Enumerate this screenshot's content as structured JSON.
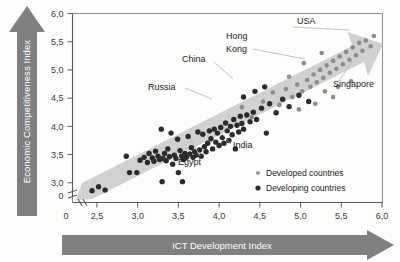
{
  "axes": {
    "y_title": "Economic Competitiveness Index",
    "x_title": "ICT Development Index",
    "y_ticks": [
      "6,0",
      "5,5",
      "5,0",
      "4,5",
      "4,0",
      "3,5",
      "3,0",
      "0"
    ],
    "x_ticks": [
      "0",
      "2,5",
      "3,0",
      "3,5",
      "4,0",
      "4,5",
      "5,0",
      "5,5",
      "6,0"
    ],
    "y_break": true,
    "x_break": true
  },
  "legend": {
    "items": [
      {
        "label": "Developed countries",
        "marker": "small-square",
        "color": "#9a9a9a"
      },
      {
        "label": "Developing countries",
        "marker": "dot",
        "color": "#2b2b2b"
      }
    ]
  },
  "annotations": [
    {
      "name": "usa",
      "text": "USA"
    },
    {
      "name": "hong-kong",
      "text": "Hong\nKong",
      "line1": "Hong",
      "line2": "Kong"
    },
    {
      "name": "china",
      "text": "China"
    },
    {
      "name": "russia",
      "text": "Russia"
    },
    {
      "name": "singapore",
      "text": "Singapore"
    },
    {
      "name": "india",
      "text": "India"
    },
    {
      "name": "egypt",
      "text": "Egypt"
    }
  ],
  "colors": {
    "arrow_gray": "#808080",
    "band_gray": "#cfcfcf",
    "developing": "#2b2b2b",
    "developed": "#8c8c8c",
    "frame": "#8e8e8e"
  },
  "chart_data": {
    "type": "scatter",
    "title": "",
    "xlabel": "ICT Development Index",
    "ylabel": "Economic Competitiveness Index",
    "xlim": [
      2.2,
      6.0
    ],
    "ylim": [
      2.65,
      6.0
    ],
    "grid": false,
    "legend_position": "inside-bottom-right",
    "trend_band": {
      "description": "shaded gray upward band with arrowhead at top-right",
      "x_start": 2.35,
      "y_start": 2.85,
      "x_end": 5.95,
      "y_end": 5.75,
      "half_width": 0.33
    },
    "series": [
      {
        "name": "Developing countries",
        "color": "#2b2b2b",
        "marker": "circle",
        "points": [
          [
            2.44,
            2.86
          ],
          [
            2.52,
            2.93
          ],
          [
            2.6,
            2.87
          ],
          [
            2.86,
            3.47
          ],
          [
            2.99,
            3.18
          ],
          [
            3.03,
            3.4
          ],
          [
            3.08,
            3.45
          ],
          [
            3.12,
            3.36
          ],
          [
            3.14,
            3.52
          ],
          [
            3.18,
            3.44
          ],
          [
            3.2,
            3.38
          ],
          [
            3.22,
            3.56
          ],
          [
            3.25,
            3.47
          ],
          [
            3.27,
            3.41
          ],
          [
            3.29,
            3.95
          ],
          [
            3.31,
            3.43
          ],
          [
            3.33,
            3.52
          ],
          [
            3.35,
            3.39
          ],
          [
            3.37,
            3.6
          ],
          [
            3.39,
            3.46
          ],
          [
            3.41,
            3.88
          ],
          [
            3.43,
            3.33
          ],
          [
            3.45,
            3.49
          ],
          [
            3.47,
            3.43
          ],
          [
            3.49,
            3.77
          ],
          [
            3.5,
            3.18
          ],
          [
            3.52,
            3.57
          ],
          [
            3.54,
            3.47
          ],
          [
            3.56,
            3.41
          ],
          [
            3.58,
            3.52
          ],
          [
            3.6,
            3.45
          ],
          [
            3.62,
            3.82
          ],
          [
            3.64,
            3.51
          ],
          [
            3.66,
            3.62
          ],
          [
            3.68,
            3.45
          ],
          [
            3.7,
            3.55
          ],
          [
            3.72,
            3.49
          ],
          [
            3.74,
            3.9
          ],
          [
            3.76,
            3.58
          ],
          [
            3.78,
            3.47
          ],
          [
            3.8,
            3.86
          ],
          [
            3.82,
            3.64
          ],
          [
            3.84,
            3.55
          ],
          [
            3.86,
            3.7
          ],
          [
            3.88,
            3.92
          ],
          [
            3.9,
            3.78
          ],
          [
            3.92,
            3.6
          ],
          [
            3.94,
            3.95
          ],
          [
            3.96,
            3.72
          ],
          [
            3.98,
            3.88
          ],
          [
            4.0,
            3.66
          ],
          [
            4.02,
            3.98
          ],
          [
            4.04,
            3.8
          ],
          [
            4.06,
            3.7
          ],
          [
            4.08,
            4.06
          ],
          [
            4.1,
            3.92
          ],
          [
            4.12,
            3.75
          ],
          [
            4.14,
            4.0
          ],
          [
            4.16,
            3.85
          ],
          [
            4.18,
            4.12
          ],
          [
            4.2,
            3.6
          ],
          [
            4.22,
            4.02
          ],
          [
            4.24,
            3.9
          ],
          [
            4.26,
            4.18
          ],
          [
            4.28,
            4.05
          ],
          [
            4.3,
            3.95
          ],
          [
            4.34,
            4.2
          ],
          [
            4.38,
            4.08
          ],
          [
            4.42,
            4.25
          ],
          [
            4.46,
            4.12
          ],
          [
            4.52,
            4.32
          ],
          [
            4.58,
            3.88
          ],
          [
            4.62,
            4.4
          ],
          [
            4.7,
            4.24
          ],
          [
            4.78,
            4.48
          ],
          [
            4.86,
            4.35
          ],
          [
            4.98,
            4.55
          ],
          [
            5.1,
            4.44
          ],
          [
            4.44,
            4.62
          ],
          [
            4.56,
            4.7
          ],
          [
            4.3,
            4.52
          ],
          [
            3.3,
            3.02
          ],
          [
            3.55,
            3.02
          ],
          [
            2.9,
            3.18
          ]
        ]
      },
      {
        "name": "Developed countries",
        "color": "#8c8c8c",
        "marker": "circle",
        "points": [
          [
            4.28,
            4.34
          ],
          [
            4.4,
            4.16
          ],
          [
            4.54,
            4.44
          ],
          [
            4.66,
            4.6
          ],
          [
            4.74,
            4.38
          ],
          [
            4.82,
            4.66
          ],
          [
            4.9,
            4.52
          ],
          [
            4.96,
            4.74
          ],
          [
            5.02,
            4.62
          ],
          [
            5.08,
            4.82
          ],
          [
            5.12,
            4.7
          ],
          [
            5.16,
            4.92
          ],
          [
            5.2,
            4.78
          ],
          [
            5.24,
            5.0
          ],
          [
            5.28,
            4.86
          ],
          [
            5.32,
            5.08
          ],
          [
            5.36,
            4.95
          ],
          [
            5.4,
            5.16
          ],
          [
            5.44,
            5.02
          ],
          [
            5.48,
            5.24
          ],
          [
            5.52,
            5.1
          ],
          [
            5.56,
            5.32
          ],
          [
            5.6,
            5.18
          ],
          [
            5.64,
            5.4
          ],
          [
            5.68,
            5.26
          ],
          [
            5.72,
            5.48
          ],
          [
            5.76,
            5.34
          ],
          [
            5.8,
            5.52
          ],
          [
            5.86,
            5.42
          ],
          [
            5.9,
            5.6
          ],
          [
            5.3,
            4.62
          ],
          [
            5.46,
            4.7
          ],
          [
            5.62,
            4.8
          ],
          [
            4.98,
            4.3
          ],
          [
            5.18,
            4.4
          ],
          [
            4.86,
            4.88
          ],
          [
            5.04,
            5.12
          ],
          [
            5.26,
            5.3
          ],
          [
            5.4,
            4.52
          ]
        ]
      }
    ],
    "labeled_points": [
      {
        "label": "USA",
        "x": 5.55,
        "y": 5.52,
        "series": "Developed countries"
      },
      {
        "label": "Singapore",
        "x": 5.3,
        "y": 4.98,
        "series": "Developed countries"
      },
      {
        "label": "Hong Kong",
        "x": 4.98,
        "y": 4.92,
        "series": "Developed countries"
      },
      {
        "label": "China",
        "x": 4.1,
        "y": 4.62,
        "series": "Developing countries"
      },
      {
        "label": "Russia",
        "x": 4.18,
        "y": 4.3,
        "series": "Developing countries"
      },
      {
        "label": "India",
        "x": 4.02,
        "y": 3.52,
        "series": "Developing countries"
      },
      {
        "label": "Egypt",
        "x": 3.92,
        "y": 3.6,
        "series": "Developing countries"
      }
    ]
  }
}
